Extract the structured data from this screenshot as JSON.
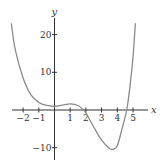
{
  "chart_data": {
    "type": "line",
    "title": "",
    "xlabel": "x",
    "ylabel": "y",
    "xlim": [
      -2.8,
      5.8
    ],
    "ylim": [
      -12,
      24
    ],
    "grid": false,
    "x_ticks": [
      -2,
      -1,
      1,
      2,
      3,
      4,
      5
    ],
    "y_ticks": [
      20,
      10,
      -10
    ],
    "series": [
      {
        "name": "f(x)",
        "color": "#8a8a8a",
        "x": [
          -2.75,
          -2.5,
          -2,
          -1.5,
          -1,
          -0.5,
          0,
          0.5,
          1,
          1.5,
          1.85,
          2,
          2.5,
          3,
          3.5,
          3.75,
          4,
          4.3,
          4.6,
          4.8,
          5,
          5.15
        ],
        "y": [
          23,
          16,
          8.5,
          4,
          2,
          1.2,
          1,
          1.3,
          1.6,
          1.2,
          0,
          -0.8,
          -4.5,
          -8,
          -10.2,
          -10.4,
          -9.5,
          -5,
          0,
          6,
          14,
          23
        ]
      }
    ]
  },
  "layout": {
    "origin_px": [
      54.5,
      110
    ],
    "x_unit_px": 15.7,
    "y_unit_px": 3.77,
    "x_axis_px": [
      12,
      148
    ],
    "y_axis_px": [
      18,
      160
    ]
  }
}
